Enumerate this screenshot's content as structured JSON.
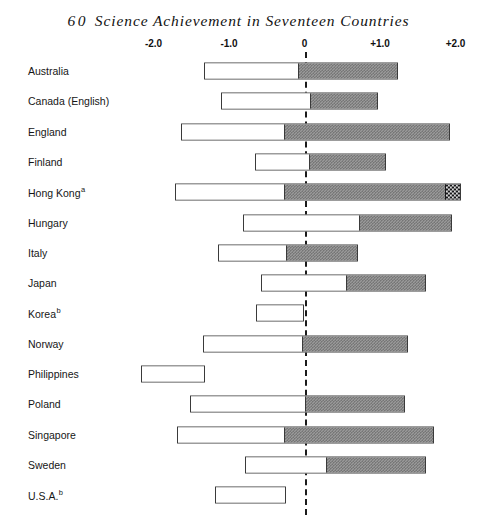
{
  "chart_data": {
    "type": "bar",
    "title_number": "60",
    "title_text": "Science Achievement in Seventeen Countries",
    "orientation": "horizontal",
    "xlabel": "",
    "ylabel": "",
    "xlim": [
      -2.4,
      2.3
    ],
    "grid": false,
    "legend": false,
    "axis_ticks": [
      {
        "label": "-2.0",
        "value": -2.0
      },
      {
        "label": "-1.0",
        "value": -1.0
      },
      {
        "label": "0",
        "value": 0.0
      },
      {
        "label": "+1.0",
        "value": 1.0
      },
      {
        "label": "+2.0",
        "value": 2.0
      }
    ],
    "reference_line": {
      "value": 0,
      "style": "dashed",
      "color": "#1b1b1b"
    },
    "segment_colors": {
      "white": "#ffffff",
      "gray": "#9a9a9a",
      "black": "#17171a"
    },
    "categories": [
      "Australia",
      "Canada (English)",
      "England",
      "Finland",
      "Hong Kong",
      "Hungary",
      "Italy",
      "Japan",
      "Korea",
      "Norway",
      "Philippines",
      "Poland",
      "Singapore",
      "Sweden",
      "U.S.A."
    ],
    "bars": [
      {
        "country": "Australia",
        "footnote": "",
        "start": -1.33,
        "split": -0.09,
        "end": 1.24,
        "has_black_cap": false,
        "black_start": null
      },
      {
        "country": "Canada (English)",
        "footnote": "",
        "start": -1.11,
        "split": 0.07,
        "end": 0.97,
        "has_black_cap": false,
        "black_start": null
      },
      {
        "country": "England",
        "footnote": "",
        "start": -1.63,
        "split": -0.28,
        "end": 1.93,
        "has_black_cap": false,
        "black_start": null
      },
      {
        "country": "Finland",
        "footnote": "",
        "start": -0.65,
        "split": 0.06,
        "end": 1.08,
        "has_black_cap": false,
        "black_start": null
      },
      {
        "country": "Hong Kong",
        "footnote": "a",
        "start": -1.72,
        "split": -0.28,
        "end": 2.07,
        "has_black_cap": true,
        "black_start": 1.87
      },
      {
        "country": "Hungary",
        "footnote": "",
        "start": -0.81,
        "split": 0.72,
        "end": 1.95,
        "has_black_cap": false,
        "black_start": null
      },
      {
        "country": "Italy",
        "footnote": "",
        "start": -1.15,
        "split": -0.25,
        "end": 0.71,
        "has_black_cap": false,
        "black_start": null
      },
      {
        "country": "Japan",
        "footnote": "",
        "start": -0.57,
        "split": 0.55,
        "end": 1.61,
        "has_black_cap": false,
        "black_start": null
      },
      {
        "country": "Korea",
        "footnote": "b",
        "start": -0.64,
        "split": 0.0,
        "end": 0.0,
        "has_black_cap": false,
        "black_start": null
      },
      {
        "country": "Norway",
        "footnote": "",
        "start": -1.35,
        "split": -0.03,
        "end": 1.37,
        "has_black_cap": false,
        "black_start": null
      },
      {
        "country": "Philippines",
        "footnote": "",
        "start": -2.16,
        "split": -1.32,
        "end": -1.32,
        "has_black_cap": false,
        "black_start": null
      },
      {
        "country": "Poland",
        "footnote": "",
        "start": -1.52,
        "split": 0.01,
        "end": 1.33,
        "has_black_cap": false,
        "black_start": null
      },
      {
        "country": "Singapore",
        "footnote": "",
        "start": -1.69,
        "split": -0.28,
        "end": 1.72,
        "has_black_cap": false,
        "black_start": null
      },
      {
        "country": "Sweden",
        "footnote": "",
        "start": -0.79,
        "split": 0.28,
        "end": 1.61,
        "has_black_cap": false,
        "black_start": null
      },
      {
        "country": "U.S.A.",
        "footnote": "b",
        "start": -1.19,
        "split": -0.25,
        "end": -0.25,
        "has_black_cap": false,
        "black_start": null
      }
    ]
  }
}
